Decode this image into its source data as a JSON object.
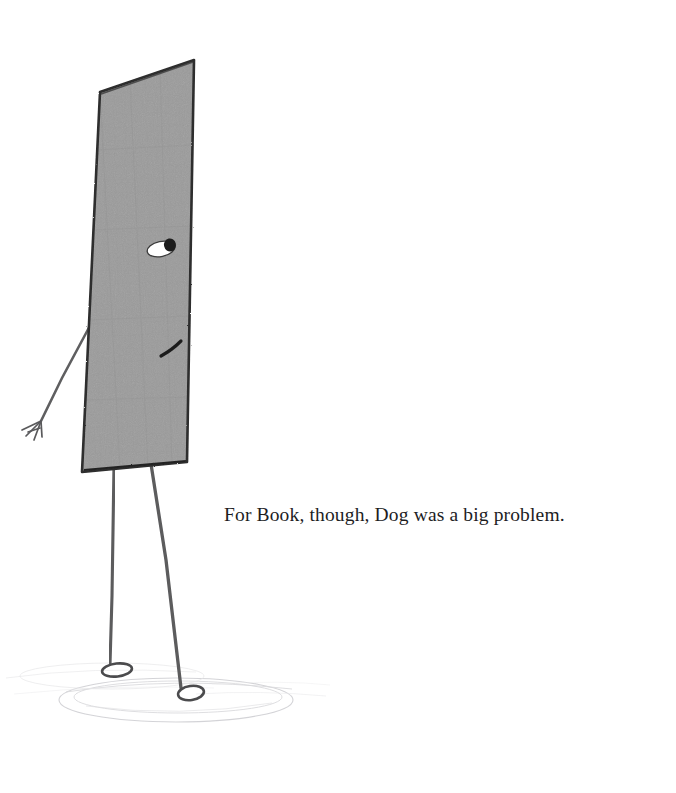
{
  "page": {
    "kind": "picture-book-page",
    "background_color": "#ffffff",
    "width": 676,
    "height": 793
  },
  "caption": {
    "text": "For Book, though, Dog was a big problem.",
    "color": "#1d1d1f"
  },
  "illustration": {
    "title": "Book character standing on shadow",
    "description": "A tall rectangular book character drawn in pencil, tilted slightly, with one eye, a small mouth, one thin arm with a splayed hand, and two long thin legs with small oval feet standing on a faint pencil ground shadow.",
    "colors": {
      "book_fill": "#9b9b9b",
      "book_fill_shade": "#8e8e8e",
      "outline": "#2b2b2b",
      "limb": "#58585a",
      "eye_white": "#ffffff",
      "pupil": "#1c1c1c",
      "shadow": "#b9b9bd"
    },
    "parts": [
      {
        "name": "book-body",
        "label": "Book body"
      },
      {
        "name": "book-eye",
        "label": "Eye"
      },
      {
        "name": "book-mouth",
        "label": "Mouth"
      },
      {
        "name": "book-arm",
        "label": "Arm"
      },
      {
        "name": "book-hand",
        "label": "Hand"
      },
      {
        "name": "book-leg-left",
        "label": "Left leg"
      },
      {
        "name": "book-leg-right",
        "label": "Right leg"
      },
      {
        "name": "book-foot-left",
        "label": "Left foot"
      },
      {
        "name": "book-foot-right",
        "label": "Right foot"
      },
      {
        "name": "ground-shadow",
        "label": "Ground shadow"
      }
    ]
  }
}
